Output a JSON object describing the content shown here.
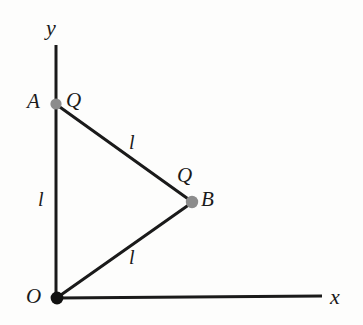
{
  "figure": {
    "background_color": "#fdfdfc",
    "line_color": "#1a1a1a",
    "axes": {
      "x_axis_label": "x",
      "y_axis_label": "y",
      "origin_label": "O"
    },
    "points": [
      {
        "id": "A",
        "label": "A",
        "charge_label": "Q",
        "marker_color": "#8c8c8c",
        "x": 56,
        "y": 104
      },
      {
        "id": "B",
        "label": "B",
        "charge_label": "Q",
        "marker_color": "#8c8c8c",
        "x": 192,
        "y": 202
      },
      {
        "id": "O",
        "label": "O",
        "charge_label": "",
        "marker_color": "#111111",
        "x": 57,
        "y": 298
      }
    ],
    "segments": [
      {
        "id": "OA",
        "from": "O",
        "to": "A",
        "length_label": "l"
      },
      {
        "id": "AB",
        "from": "A",
        "to": "B",
        "length_label": "l"
      },
      {
        "id": "OB",
        "from": "O",
        "to": "B",
        "length_label": "l"
      }
    ]
  }
}
